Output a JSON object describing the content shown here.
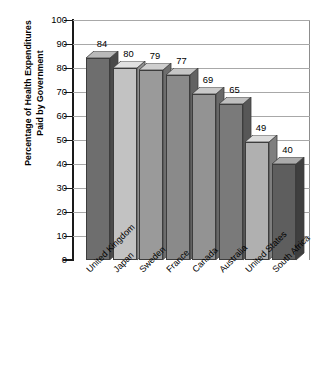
{
  "chart_data": {
    "type": "bar",
    "title": "",
    "subtitle": "",
    "xlabel": "",
    "ylabel_line1": "Percentage of Health Expenditures",
    "ylabel_line2": "Paid by Government",
    "categories": [
      "United Kingdom",
      "Japan",
      "Sweden",
      "France",
      "Canada",
      "Australia",
      "United States",
      "South Africa"
    ],
    "values": [
      84,
      80,
      79,
      77,
      69,
      65,
      49,
      40
    ],
    "value_labels": [
      "84",
      "80",
      "79",
      "77",
      "69",
      "65",
      "49",
      "40"
    ],
    "ylim": [
      0,
      100
    ],
    "ytick_step": 10,
    "ytick_labels": [
      "100",
      "90",
      "80",
      "70",
      "60",
      "50",
      "40",
      "30",
      "20",
      "10",
      "0"
    ],
    "grid": true,
    "grid_orientation": "horizontal",
    "legend": false,
    "legend_position": "none",
    "style": "3d-column",
    "bar_colors": [
      "#6e6e6e",
      "#c2c2c2",
      "#9a9a9a",
      "#8a8a8a",
      "#939393",
      "#7a7a7a",
      "#b0b0b0",
      "#5e5e5e"
    ],
    "bar_top_colors": [
      "#b9b9b9",
      "#e2e2e2",
      "#cfcfcf",
      "#c6c6c6",
      "#c9c9c9",
      "#bfbfbf",
      "#dcdcdc",
      "#ababab"
    ],
    "bar_side_colors": [
      "#4a4a4a",
      "#8f8f8f",
      "#6d6d6d",
      "#626262",
      "#686868",
      "#575757",
      "#7e7e7e",
      "#3f3f3f"
    ],
    "axis_color": "#1a1a1a",
    "grid_color": "#a8a8a8",
    "background": "#ffffff"
  }
}
